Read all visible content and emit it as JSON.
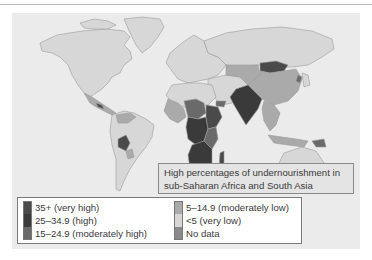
{
  "map": {
    "title": "World undernourishment prevalence",
    "callout": {
      "line1": "High percentages of undernourishment in",
      "line2": "sub-Saharan Africa and South Asia"
    },
    "colors": {
      "ocean": "#ebebeb",
      "country_border": "#9a9a9a",
      "very_high": "#4a4a4a",
      "high": "#3a3a3a",
      "moderately_high": "#6a6a6a",
      "moderately_low": "#aaaaaa",
      "very_low": "#d7d7d7",
      "no_data": "#8a8a8a"
    }
  },
  "legend": {
    "column1": [
      {
        "label": "35+ (very high)",
        "color": "#4a4a4a"
      },
      {
        "label": "25–34.9 (high)",
        "color": "#3a3a3a"
      },
      {
        "label": "15–24.9 (moderately high)",
        "color": "#6a6a6a"
      }
    ],
    "column2": [
      {
        "label": "5–14.9 (moderately low)",
        "color": "#aaaaaa"
      },
      {
        "label": "<5 (very low)",
        "color": "#d7d7d7"
      },
      {
        "label": "No data",
        "color": "#8a8a8a"
      }
    ]
  }
}
